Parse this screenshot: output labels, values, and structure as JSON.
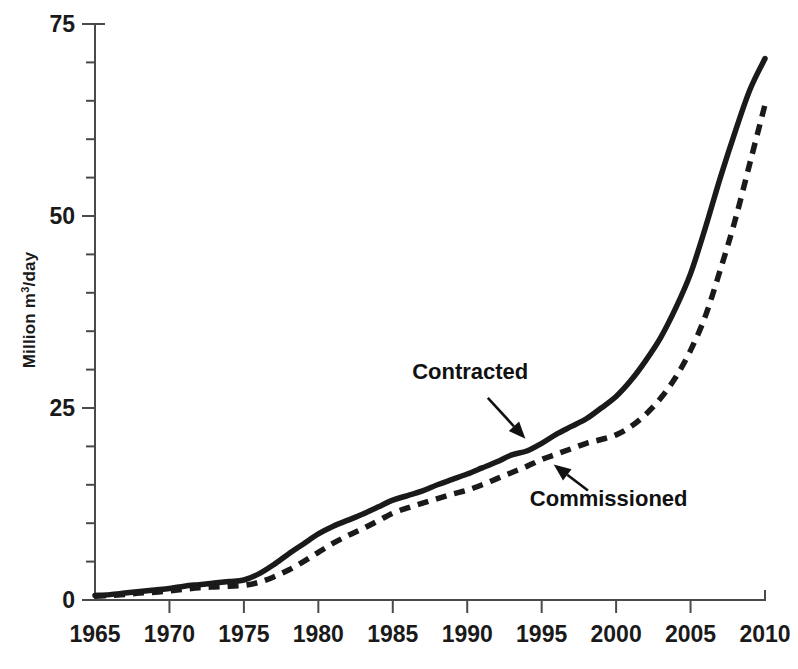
{
  "chart_data": {
    "type": "line",
    "title": "",
    "subtitle": "",
    "xlabel": "",
    "ylabel": "Million m³/day",
    "ylabel_main": "Million m",
    "ylabel_sup": "3",
    "ylabel_tail": "/day",
    "xlim": [
      1965,
      2010
    ],
    "ylim": [
      0,
      75
    ],
    "grid": false,
    "legend_position": "inline-annotations",
    "x_ticks": [
      1965,
      1970,
      1975,
      1980,
      1985,
      1990,
      1995,
      2000,
      2005,
      2010
    ],
    "x_tick_labels": [
      "1965",
      "1970",
      "1975",
      "1980",
      "1985",
      "1990",
      "1995",
      "2000",
      "2005",
      "2010"
    ],
    "y_ticks": [
      0,
      25,
      50,
      75
    ],
    "y_tick_labels": [
      "0",
      "25",
      "50",
      "75"
    ],
    "y_minor_step": 5,
    "x": [
      1965,
      1966,
      1967,
      1968,
      1969,
      1970,
      1971,
      1972,
      1973,
      1974,
      1975,
      1976,
      1977,
      1978,
      1979,
      1980,
      1981,
      1982,
      1983,
      1984,
      1985,
      1986,
      1987,
      1988,
      1989,
      1990,
      1991,
      1992,
      1993,
      1994,
      1995,
      1996,
      1997,
      1998,
      1999,
      2000,
      2001,
      2002,
      2003,
      2004,
      2005,
      2006,
      2007,
      2008,
      2009,
      2010
    ],
    "series": [
      {
        "name": "Contracted",
        "style": "solid",
        "color": "#1a1a1a",
        "values": [
          0.6,
          0.7,
          0.9,
          1.1,
          1.3,
          1.5,
          1.8,
          2.0,
          2.2,
          2.4,
          2.6,
          3.4,
          4.6,
          6.0,
          7.3,
          8.6,
          9.6,
          10.4,
          11.2,
          12.1,
          13.0,
          13.6,
          14.2,
          15.0,
          15.7,
          16.4,
          17.2,
          18.0,
          18.9,
          19.4,
          20.4,
          21.6,
          22.6,
          23.6,
          25.0,
          26.5,
          28.6,
          31.2,
          34.2,
          38.0,
          42.5,
          48.5,
          55.0,
          61.0,
          66.5,
          70.5
        ]
      },
      {
        "name": "Commissioned",
        "style": "dashed",
        "color": "#1a1a1a",
        "values": [
          0.5,
          0.6,
          0.7,
          0.9,
          1.0,
          1.2,
          1.4,
          1.6,
          1.7,
          1.8,
          1.9,
          2.3,
          3.0,
          3.9,
          5.0,
          6.2,
          7.4,
          8.4,
          9.3,
          10.3,
          11.3,
          12.0,
          12.6,
          13.2,
          13.8,
          14.3,
          15.0,
          15.8,
          16.6,
          17.4,
          18.3,
          19.0,
          19.7,
          20.4,
          20.9,
          21.5,
          22.6,
          24.2,
          26.3,
          29.0,
          32.5,
          37.0,
          43.0,
          49.5,
          57.0,
          64.5
        ]
      }
    ],
    "annotations": [
      {
        "text": "Contracted",
        "target_series": "Contracted",
        "label_x": 1990.2,
        "label_y": 28.8,
        "point_x": 1994.0,
        "point_y": 20.8
      },
      {
        "text": "Commissioned",
        "target_series": "Commissioned",
        "label_x": 1999.5,
        "label_y": 12.2,
        "point_x": 1995.7,
        "point_y": 17.8
      }
    ]
  }
}
